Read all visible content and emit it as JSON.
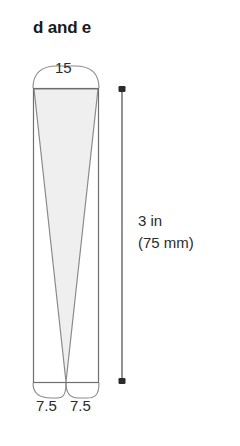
{
  "title": "d and e",
  "figure": {
    "type": "geometry-diagram",
    "labels": {
      "top_width": "15",
      "bottom_left_half": "7.5",
      "bottom_right_half": "7.5",
      "height_inches": "3 in",
      "height_mm": "(75 mm)"
    },
    "dimensions": {
      "top_width_value": 15,
      "bottom_left_value": 7.5,
      "bottom_right_value": 7.5,
      "height_value_in": 3,
      "height_value_mm": 75
    },
    "colors": {
      "outline": "#6e6e6e",
      "triangle_fill": "#efefef",
      "triangle_stroke": "#8a8a8a",
      "brace": "#7a7a7a",
      "dimension_line": "#4a4a4a",
      "text": "#2b2b2b",
      "background": "#ffffff"
    }
  }
}
